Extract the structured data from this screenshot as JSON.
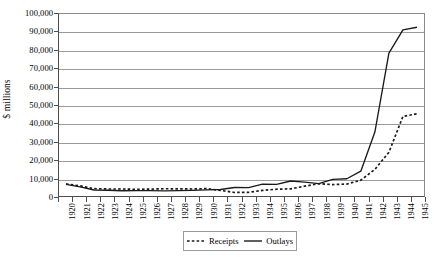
{
  "chart_data": {
    "type": "line",
    "title": "",
    "xlabel": "",
    "ylabel": "$ millions",
    "ylim": [
      0,
      100000
    ],
    "ytick_values": [
      0,
      10000,
      20000,
      30000,
      40000,
      50000,
      60000,
      70000,
      80000,
      90000,
      100000
    ],
    "ytick_labels": [
      "0",
      "10,000",
      "20,000",
      "30,000",
      "40,000",
      "50,000",
      "60,000",
      "70,000",
      "80,000",
      "90,000",
      "100,000"
    ],
    "grid": true,
    "legend_position": "bottom-center",
    "x": [
      1920,
      1921,
      1922,
      1923,
      1924,
      1925,
      1926,
      1927,
      1928,
      1929,
      1930,
      1931,
      1932,
      1933,
      1934,
      1935,
      1936,
      1937,
      1938,
      1939,
      1940,
      1941,
      1942,
      1943,
      1944,
      1945
    ],
    "categories": [
      "1920",
      "1921",
      "1922",
      "1923",
      "1924",
      "1925",
      "1926",
      "1927",
      "1928",
      "1929",
      "1930",
      "1931",
      "1932",
      "1933",
      "1934",
      "1935",
      "1936",
      "1937",
      "1938",
      "1939",
      "1940",
      "1941",
      "1942",
      "1943",
      "1944",
      "1945"
    ],
    "series": [
      {
        "name": "Receipts",
        "style": "dashed",
        "color": "#1a1a1a",
        "values": [
          6649,
          5571,
          4026,
          3853,
          3871,
          3641,
          3795,
          4013,
          3900,
          3862,
          4058,
          3116,
          1924,
          2021,
          3064,
          3730,
          3923,
          5387,
          6751,
          6295,
          6548,
          8712,
          14634,
          24001,
          43747,
          45159
        ]
      },
      {
        "name": "Outlays",
        "style": "solid",
        "color": "#1a1a1a",
        "values": [
          6358,
          5062,
          3289,
          3140,
          2908,
          2924,
          2930,
          2857,
          2961,
          3127,
          3320,
          3577,
          4659,
          4598,
          6541,
          6412,
          8228,
          7580,
          6840,
          9141,
          9468,
          13653,
          35137,
          78555,
          91304,
          92712
        ]
      }
    ]
  },
  "legend": {
    "entries": [
      {
        "label": "Receipts",
        "icon": "dashed-line-icon"
      },
      {
        "label": "Outlays",
        "icon": "solid-line-icon"
      }
    ]
  }
}
